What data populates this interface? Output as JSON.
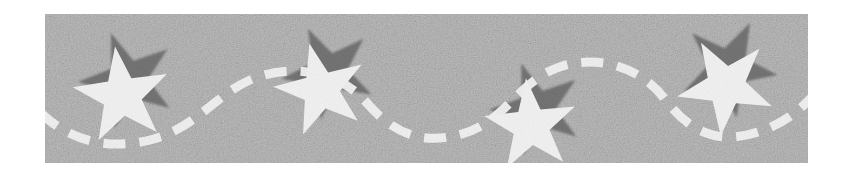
{
  "artwork": {
    "title": "Decorative star banner",
    "kind": "scanned-clipart-banner",
    "canvas": {
      "width": 851,
      "height": 183,
      "page_background": "#ffffff"
    },
    "band": {
      "label": "gray textured band",
      "x": 45,
      "y": 14,
      "width": 763,
      "height": 149,
      "fill": "#c9c9c9",
      "texture": "photocopy grain speckle",
      "grain_light": "#e4e4e4",
      "grain_dark": "#a9a9a9"
    },
    "palette": {
      "background_gray": "#c9c9c9",
      "star_white": "#ffffff",
      "shadow_gray": "#6f6f6f",
      "shadow_gray_soft": "#8d8d8d",
      "page_white": "#ffffff"
    },
    "stars": [
      {
        "name": "star-1",
        "cx": 122,
        "cy": 96,
        "outer_radius": 50,
        "inner_radius": 20,
        "rotation_deg": -8,
        "fill": "#ffffff",
        "shadow": {
          "dx": 6,
          "dy": -16,
          "rotation_deg": -20,
          "fill": "#6f6f6f"
        }
      },
      {
        "name": "star-2",
        "cx": 321,
        "cy": 90,
        "outer_radius": 48,
        "inner_radius": 19,
        "rotation_deg": -14,
        "fill": "#ffffff",
        "shadow": {
          "dx": 8,
          "dy": -18,
          "rotation_deg": -26,
          "fill": "#6f6f6f"
        }
      },
      {
        "name": "star-3",
        "cx": 531,
        "cy": 126,
        "outer_radius": 48,
        "inner_radius": 19,
        "rotation_deg": -6,
        "fill": "#ffffff",
        "shadow": {
          "dx": 6,
          "dy": -17,
          "rotation_deg": -19,
          "fill": "#6f6f6f"
        }
      },
      {
        "name": "star-4",
        "cx": 726,
        "cy": 86,
        "outer_radius": 50,
        "inner_radius": 20,
        "rotation_deg": 186,
        "fill": "#ffffff",
        "shadow": {
          "dx": 2,
          "dy": -18,
          "rotation_deg": 170,
          "fill": "#6f6f6f"
        }
      }
    ],
    "wave": {
      "name": "dashed-wave-line",
      "stroke": "#ffffff",
      "stroke_width": 9,
      "dash_pattern": "22 14",
      "linecap": "butt",
      "description": "white dashed sinusoidal ribbon weaving left to right through the stars",
      "path": "M 40 112 C 70 142, 110 150, 150 140 C 196 128, 214 96, 250 80 C 292 62, 340 72, 366 102 C 392 132, 420 146, 462 134 C 504 122, 516 86, 552 70 C 592 52, 640 66, 664 98 C 688 130, 716 146, 758 132 C 796 120, 812 96, 830 78"
    }
  }
}
